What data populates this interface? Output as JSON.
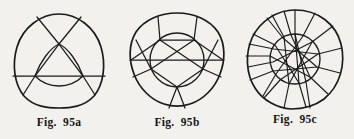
{
  "plate": {
    "background_color": "#f2f1ee",
    "ink_color": "#1b1b1b",
    "figure_count": 3
  },
  "figures": [
    {
      "id": "95a",
      "caption": "Fig.  95a",
      "description": "rounded-triangle outline with inner rounded triangle and three crossing chords",
      "outline_shape": "reuleaux-triangle",
      "inner_shape": "rounded-triangle",
      "chord_count": 3,
      "center": {
        "x": 59,
        "y": 56
      }
    },
    {
      "id": "95b",
      "caption": "Fig.  95b",
      "description": "rounded-pentagon outline with inner circle and five-pointed star chords extended to the rim",
      "outline_shape": "rounded-pentagon",
      "inner_shape": "circle",
      "chord_count": 5,
      "center": {
        "x": 59,
        "y": 56
      }
    },
    {
      "id": "95c",
      "caption": "Fig.  95c",
      "description": "circular outline with inner circle and many radial spokes forming a star polygon",
      "outline_shape": "circle",
      "inner_shape": "circle",
      "chord_count": 13,
      "center": {
        "x": 59,
        "y": 56
      }
    }
  ],
  "captions": {
    "a": "Fig.  95a",
    "b": "Fig.  95b",
    "c": "Fig.  95c"
  }
}
